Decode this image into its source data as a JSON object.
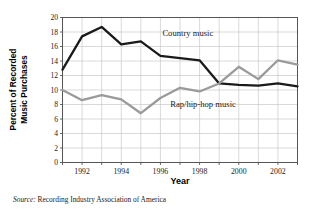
{
  "chart_data": {
    "type": "line",
    "title": "",
    "xlabel": "Year",
    "ylabel": "Percent of Recorded Music Purchases",
    "x": [
      1991,
      1992,
      1993,
      1994,
      1995,
      1996,
      1997,
      1998,
      1999,
      2000,
      2001,
      2002,
      2003
    ],
    "xtick_labels": [
      "1992",
      "1994",
      "1996",
      "1998",
      "2000",
      "2002"
    ],
    "xtick_values": [
      1992,
      1994,
      1996,
      1998,
      2000,
      2002
    ],
    "xlim": [
      1991,
      2003
    ],
    "ytick_labels": [
      "0",
      "2",
      "4",
      "6",
      "8",
      "10",
      "12",
      "14",
      "16",
      "18",
      "20"
    ],
    "ytick_values": [
      0,
      2,
      4,
      6,
      8,
      10,
      12,
      14,
      16,
      18,
      20
    ],
    "ylim": [
      0,
      20
    ],
    "grid": true,
    "legend_position": "inline-annotation",
    "series": [
      {
        "name": "Country music",
        "color": "#1a1a1a",
        "values": [
          12.8,
          17.4,
          18.7,
          16.3,
          16.7,
          14.7,
          14.4,
          14.1,
          10.9,
          10.7,
          10.6,
          10.9,
          10.5
        ]
      },
      {
        "name": "Rap/hip-hop music",
        "color": "#9a9a9a",
        "values": [
          10.0,
          8.6,
          9.3,
          8.7,
          6.8,
          8.9,
          10.3,
          9.8,
          10.9,
          13.2,
          11.5,
          14.1,
          13.5
        ]
      }
    ],
    "annotations": [
      {
        "text": "Country music",
        "x": 1996.1,
        "y": 17.4
      },
      {
        "text": "Rap/hip-hop music",
        "x": 1996.5,
        "y": 7.6
      }
    ]
  },
  "source": {
    "label": "Source:",
    "text": "Recording Industry Association of America"
  },
  "colors": {
    "country": "#1a1a1a",
    "rap": "#9a9a9a",
    "grid": "#c8c8c8",
    "frame": "#555555",
    "text": "#1a1a1a"
  }
}
